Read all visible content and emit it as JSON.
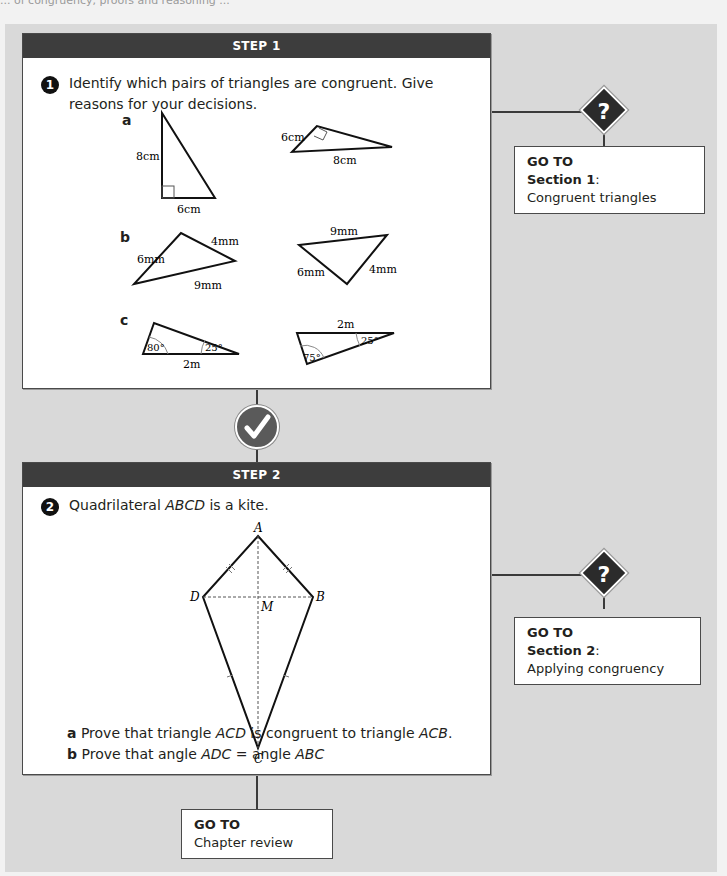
{
  "page": {
    "top_cutoff_text": "... of congruency, proofs and reasoning ..."
  },
  "step1": {
    "header": "STEP 1",
    "question_number": "1",
    "question_text": "Identify which pairs of triangles are congruent. Give reasons for your decisions.",
    "parts": [
      {
        "label": "a",
        "left_triangle": {
          "sides": [
            "8cm",
            "6cm"
          ],
          "right_angle": true
        },
        "right_triangle": {
          "sides": [
            "6cm",
            "8cm"
          ],
          "right_angle": true
        }
      },
      {
        "label": "b",
        "left_triangle": {
          "sides": [
            "6mm",
            "4mm",
            "9mm"
          ]
        },
        "right_triangle": {
          "sides": [
            "9mm",
            "6mm",
            "4mm"
          ]
        }
      },
      {
        "label": "c",
        "left_triangle": {
          "side": "2m",
          "angles": [
            "80°",
            "25°"
          ]
        },
        "right_triangle": {
          "side": "2m",
          "angles": [
            "25°",
            "75°"
          ]
        }
      }
    ],
    "goto": {
      "title": "GO TO",
      "section": "Section 1",
      "topic": "Congruent triangles"
    }
  },
  "step2": {
    "header": "STEP 2",
    "question_number": "2",
    "question_prefix": "Quadrilateral ",
    "question_italic": "ABCD",
    "question_suffix": " is a kite.",
    "kite_labels": {
      "A": "A",
      "B": "B",
      "C": "C",
      "D": "D",
      "M": "M"
    },
    "parts": [
      {
        "label": "a",
        "pre": "Prove that triangle ",
        "it1": "ACD",
        "mid": " is congruent to triangle ",
        "it2": "ACB",
        "post": "."
      },
      {
        "label": "b",
        "pre": "Prove that angle ",
        "it1": "ADC",
        "mid": " = angle ",
        "it2": "ABC",
        "post": ""
      }
    ],
    "goto": {
      "title": "GO TO",
      "section": "Section 2",
      "topic": "Applying congruency"
    }
  },
  "final_goto": {
    "title": "GO TO",
    "topic": "Chapter review"
  },
  "icons": {
    "question": "?",
    "check": "✓"
  },
  "colors": {
    "header_bg": "#3d3d3d",
    "panel_bg": "#d9d9d9",
    "diamond": "#2b2b2b",
    "check": "#5a5a5a"
  }
}
